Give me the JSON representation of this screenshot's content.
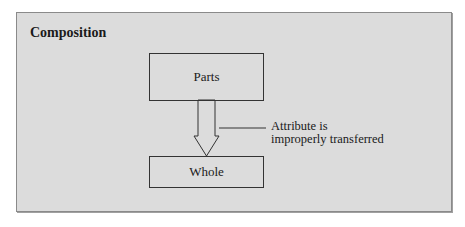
{
  "diagram": {
    "title": "Composition",
    "nodes": [
      {
        "id": "parts",
        "label": "Parts"
      },
      {
        "id": "whole",
        "label": "Whole"
      }
    ],
    "edge": {
      "from": "parts",
      "to": "whole",
      "style": "hollow-block-arrow"
    },
    "annotation": {
      "line1": "Attribute is",
      "line2": "improperly transferred"
    },
    "colors": {
      "background": "#dcdcdc",
      "stroke": "#333333",
      "border": "#8a8a8a"
    }
  }
}
